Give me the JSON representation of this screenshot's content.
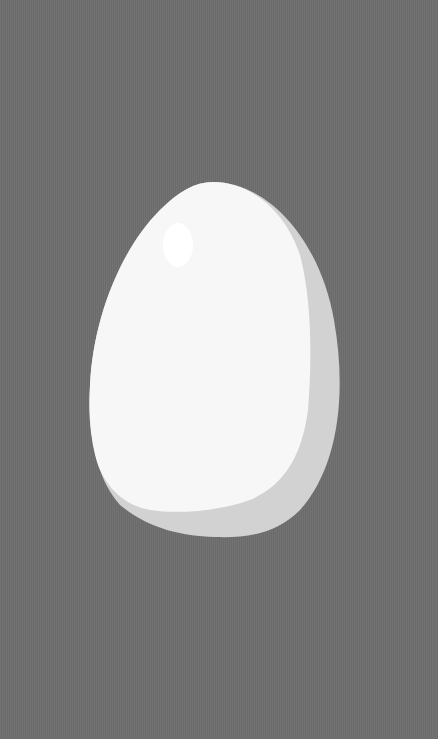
{
  "scene": {
    "subject": "egg",
    "description": "White egg on a gray background",
    "colors": {
      "background": "#6e6e6e",
      "egg_body": "#f7f7f7",
      "egg_shadow": "#d2d2d2",
      "egg_highlight": "#ffffff"
    }
  }
}
